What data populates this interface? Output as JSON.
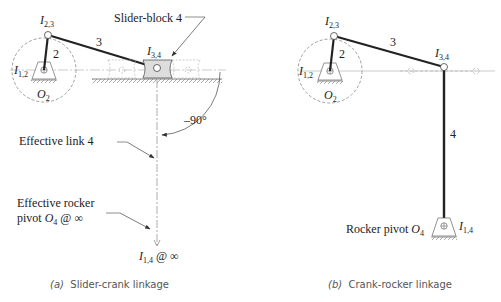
{
  "panel_a": {
    "caption_prefix": "(a)",
    "caption": "Slider-crank linkage",
    "labels": {
      "i23": "I",
      "i23_sub": "2,3",
      "i12": "I",
      "i12_sub": "1,2",
      "o2": "O",
      "o2_sub": "2",
      "link2": "2",
      "link3": "3",
      "i34": "I",
      "i34_sub": "3,4",
      "slider_block": "Slider-block 4",
      "angle": "–90°",
      "effective_link": "Effective link 4",
      "rocker_line1": "Effective rocker",
      "rocker_line2_prefix": "pivot ",
      "rocker_o": "O",
      "rocker_o_sub": "4",
      "rocker_suffix": " @ ∞",
      "i14": "I",
      "i14_sub": "1,4",
      "i14_suffix": " @ ∞"
    }
  },
  "panel_b": {
    "caption_prefix": "(b)",
    "caption": "Crank-rocker linkage",
    "labels": {
      "i23": "I",
      "i23_sub": "2,3",
      "i12": "I",
      "i12_sub": "1,2",
      "o2": "O",
      "o2_sub": "2",
      "link2": "2",
      "link3": "3",
      "i34": "I",
      "i34_sub": "3,4",
      "link4": "4",
      "rocker_pivot": "Rocker pivot ",
      "o4": "O",
      "o4_sub": "4",
      "i14": "I",
      "i14_sub": "1,4"
    }
  }
}
